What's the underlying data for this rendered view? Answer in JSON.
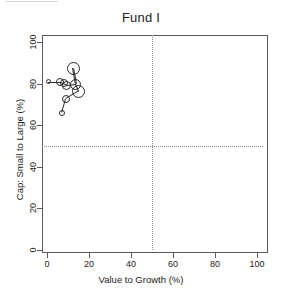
{
  "page": {
    "top_artifact_text": "_________"
  },
  "chart_data": {
    "type": "scatter",
    "title": "Fund I",
    "xlabel": "Value to Growth (%)",
    "ylabel": "Cap: Small to Large (%)",
    "xlim": [
      0,
      100
    ],
    "ylim": [
      0,
      100
    ],
    "xticks": [
      0,
      20,
      40,
      60,
      80,
      100
    ],
    "yticks": [
      0,
      20,
      40,
      60,
      80,
      100
    ],
    "xtick_labels": [
      "0",
      "20",
      "40",
      "60",
      "80",
      "100"
    ],
    "ytick_labels": [
      "0",
      "20",
      "40",
      "60",
      "80",
      "100"
    ],
    "grid": false,
    "legend": "none",
    "reference_lines": {
      "vertical_x": 50,
      "horizontal_y": 50,
      "style": "dotted",
      "color": "#8d8d8d"
    },
    "marker": {
      "shape": "open-circle",
      "edge_color": "#2b2b2b",
      "fill": "none"
    },
    "path_connected": true,
    "points": [
      {
        "x": 12.4,
        "y": 87.5,
        "size": 13
      },
      {
        "x": 13.8,
        "y": 79.8,
        "size": 11
      },
      {
        "x": 15.2,
        "y": 76.4,
        "size": 13
      },
      {
        "x": 9.5,
        "y": 79.3,
        "size": 9
      },
      {
        "x": 8.1,
        "y": 80.3,
        "size": 8
      },
      {
        "x": 6.2,
        "y": 80.8,
        "size": 8
      },
      {
        "x": 0.5,
        "y": 80.8,
        "size": 5
      },
      {
        "x": 9.0,
        "y": 72.6,
        "size": 8
      },
      {
        "x": 7.1,
        "y": 65.9,
        "size": 6
      }
    ],
    "path_order": [
      6,
      5,
      4,
      3,
      1,
      0,
      1,
      2,
      7,
      8
    ]
  }
}
